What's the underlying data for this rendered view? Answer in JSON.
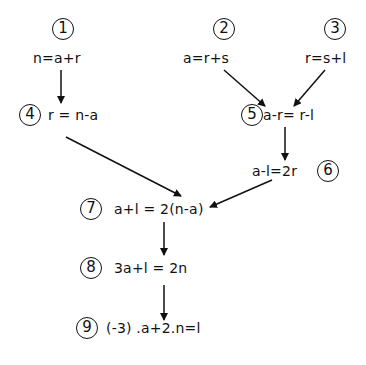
{
  "nodes": [
    {
      "id": "1",
      "equation": "n=a+r"
    },
    {
      "id": "2",
      "equation": "a=r+s"
    },
    {
      "id": "3",
      "equation": "r=s+l"
    },
    {
      "id": "4",
      "equation": "r = n-a"
    },
    {
      "id": "5",
      "equation": "a-r= r-l"
    },
    {
      "id": "6",
      "equation": "a-l=2r"
    },
    {
      "id": "7",
      "equation": "a+l = 2(n-a)"
    },
    {
      "id": "8",
      "equation": "3a+l = 2n"
    },
    {
      "id": "9",
      "equation": "(-3) .a+2.n=l"
    }
  ],
  "edges": [
    {
      "from": "1",
      "to": "4"
    },
    {
      "from": "2",
      "to": "5"
    },
    {
      "from": "3",
      "to": "5"
    },
    {
      "from": "5",
      "to": "6"
    },
    {
      "from": "4",
      "to": "7"
    },
    {
      "from": "6",
      "to": "7"
    },
    {
      "from": "7",
      "to": "8"
    },
    {
      "from": "8",
      "to": "9"
    }
  ]
}
